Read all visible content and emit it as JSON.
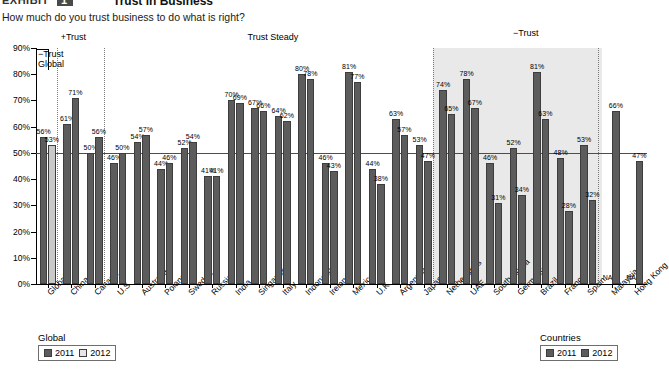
{
  "header": {
    "exhibit_tag": "EXHIBIT",
    "exhibit_number": "1",
    "title": "Trust in Business",
    "subtitle": "How much do you trust business to do what is right?"
  },
  "sections": [
    {
      "label": "+Trust"
    },
    {
      "label": "Trust Steady"
    },
    {
      "label": "−Trust"
    }
  ],
  "bracket_label_line1": "−Trust",
  "bracket_label_line2": "Global",
  "legends": {
    "left": {
      "title": "Global",
      "items": [
        {
          "label": "2011",
          "color": "#5c5c5c"
        },
        {
          "label": "2012",
          "color": "#e6e6e6"
        }
      ]
    },
    "right": {
      "title": "Countries",
      "items": [
        {
          "label": "2011",
          "color": "#5c5c5c"
        },
        {
          "label": "2012",
          "color": "#5c5c5c"
        }
      ]
    }
  },
  "chart_data": {
    "type": "bar",
    "title": "Trust in Business",
    "subtitle": "How much do you trust business to do what is right?",
    "xlabel": "",
    "ylabel": "",
    "ylim": [
      0,
      90
    ],
    "ytick_labels": [
      "0%",
      "10%",
      "20%",
      "30%",
      "40%",
      "50%",
      "60%",
      "70%",
      "80%",
      "90%"
    ],
    "ytick_values": [
      0,
      10,
      20,
      30,
      40,
      50,
      60,
      70,
      80,
      90
    ],
    "grid": false,
    "reference_line": {
      "value": 50,
      "label": "50%"
    },
    "legend_position": "bottom",
    "categories": [
      "Global",
      "China",
      "Canada",
      "U.S.",
      "Australia",
      "Poland",
      "Sweden",
      "Russia",
      "India",
      "Singapore",
      "Italy",
      "Indonesia",
      "Ireland",
      "Mexico",
      "U.K.",
      "Argentina",
      "Japan",
      "Netherlands",
      "UAE",
      "South Korea",
      "Germany",
      "Brazil",
      "France",
      "Spain",
      "Malaysia",
      "Hong Kong"
    ],
    "series": [
      {
        "name": "2011",
        "values": [
          56,
          61,
          50,
          46,
          54,
          44,
          52,
          41,
          70,
          67,
          64,
          80,
          46,
          81,
          44,
          63,
          53,
          74,
          78,
          46,
          52,
          81,
          48,
          53,
          null,
          null
        ],
        "labels": [
          "56%",
          "61%",
          "50%",
          "46%",
          "54%",
          "44%",
          "52%",
          "41%",
          "70%",
          "67%",
          "64%",
          "80%",
          "46%",
          "81%",
          "44%",
          "63%",
          "53%",
          "74%",
          "78%",
          "46%",
          "52%",
          "81%",
          "48%",
          "53%",
          "NA",
          "NA"
        ]
      },
      {
        "name": "2012",
        "values": [
          53,
          71,
          56,
          50,
          57,
          46,
          54,
          41,
          69,
          66,
          62,
          78,
          43,
          77,
          38,
          57,
          47,
          65,
          67,
          31,
          34,
          63,
          28,
          32,
          66,
          47
        ],
        "labels": [
          "53%",
          "71%",
          "56%",
          "50%",
          "57%",
          "46%",
          "54%",
          "41%",
          "69%",
          "66%",
          "62%",
          "78%",
          "43%",
          "77%",
          "38%",
          "57%",
          "47%",
          "65%",
          "67%",
          "31%",
          "34%",
          "63%",
          "28%",
          "32%",
          "66%",
          "47%"
        ]
      }
    ],
    "group_bands": [
      {
        "label": "+Trust",
        "from": "China",
        "to": "Canada"
      },
      {
        "label": "Trust Steady",
        "from": "U.S.",
        "to": "Japan"
      },
      {
        "label": "−Trust",
        "from": "Netherlands",
        "to": "Spain",
        "shaded": true
      }
    ]
  }
}
